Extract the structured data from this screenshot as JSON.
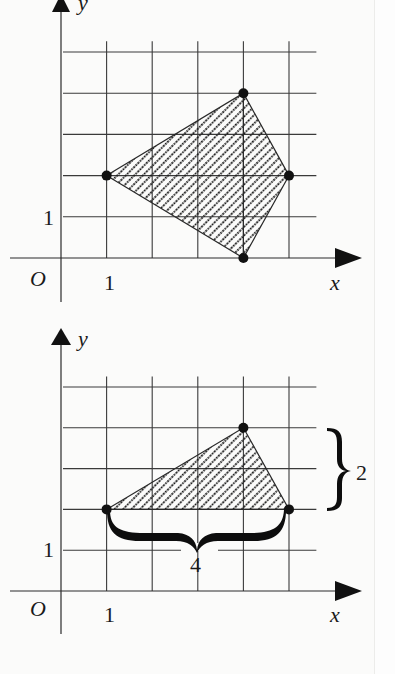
{
  "figures": [
    {
      "id": "top",
      "description": "Quadrilateral on coordinate grid",
      "origin_px": [
        61,
        258
      ],
      "unit_px": [
        45.6,
        41.2
      ],
      "grid": {
        "x_lines": [
          1,
          2,
          3,
          4,
          5
        ],
        "y_lines": [
          1,
          2,
          3,
          4,
          5
        ],
        "x_extent": [
          0.05,
          5.6
        ],
        "y_extent": [
          0,
          5.55
        ]
      },
      "axes": {
        "x_label": "x",
        "y_label": "y",
        "origin_label": "O",
        "x_tick_label": "1",
        "y_tick_label": "1"
      },
      "shape": {
        "type": "quadrilateral",
        "fill": "diagonal-dotted-hatch",
        "vertices": [
          [
            1,
            2
          ],
          [
            4,
            4
          ],
          [
            5,
            2
          ],
          [
            4,
            0
          ]
        ]
      },
      "inner_lines": [
        [
          [
            4,
            4
          ],
          [
            4,
            0
          ]
        ]
      ]
    },
    {
      "id": "bottom",
      "description": "Triangle with base and height braces",
      "origin_px": [
        61,
        591
      ],
      "unit_px": [
        45.6,
        40.8
      ],
      "grid": {
        "x_lines": [
          1,
          2,
          3,
          4,
          5
        ],
        "y_lines": [
          1,
          2,
          3,
          4,
          5
        ],
        "x_extent": [
          0.05,
          5.6
        ],
        "y_extent": [
          0,
          5.55
        ]
      },
      "axes": {
        "x_label": "x",
        "y_label": "y",
        "origin_label": "O",
        "x_tick_label": "1",
        "y_tick_label": "1"
      },
      "shape": {
        "type": "triangle",
        "fill": "diagonal-dotted-hatch",
        "vertices": [
          [
            1,
            2
          ],
          [
            4,
            4
          ],
          [
            5,
            2
          ]
        ]
      },
      "annotations": {
        "base_brace_label": "4",
        "height_brace_label": "2"
      }
    }
  ],
  "colors": {
    "ink": "#1a1a1a",
    "grid": "#3a3a3a",
    "background": "#fbfbfa"
  }
}
